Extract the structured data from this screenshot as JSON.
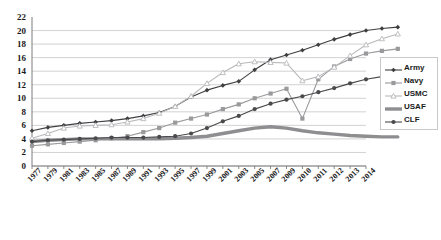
{
  "chart": {
    "type": "line",
    "title": "",
    "xlabel": "",
    "ylabel": "",
    "grid": true,
    "legend_position": "right",
    "ylim": [
      0,
      22
    ],
    "yticks": [
      0,
      2,
      4,
      6,
      8,
      10,
      12,
      14,
      16,
      18,
      20,
      22
    ],
    "xticks": [
      "1977",
      "1979",
      "1981",
      "1983",
      "1985",
      "1987",
      "1989",
      "1991",
      "1993",
      "1995",
      "1997",
      "1999",
      "2001",
      "2003",
      "2005",
      "2007",
      "2009",
      "2010",
      "2011",
      "2012",
      "2013",
      "2014"
    ],
    "colors": {
      "army": "#3f3f42",
      "navy": "#9a9a9d",
      "usmc": "#b9b9bc",
      "usaf": "#8e8e91",
      "clf": "#4a4a4d",
      "grid": "#c6c6c8",
      "axis": "#7d7d80",
      "text": "#1a1a1a"
    },
    "series": [
      {
        "name": "Army",
        "marker": "diamond",
        "values": [
          5.2,
          5.7,
          6.0,
          6.3,
          6.5,
          6.7,
          7.0,
          7.4,
          7.9,
          8.8,
          10.2,
          11.2,
          11.9,
          12.5,
          14.2,
          15.7,
          16.4,
          17.1,
          17.9,
          18.7,
          19.4,
          20.0,
          20.3,
          20.5
        ]
      },
      {
        "name": "Navy",
        "marker": "square",
        "values": [
          3.0,
          3.2,
          3.4,
          3.6,
          3.8,
          4.1,
          4.4,
          5.0,
          5.6,
          6.4,
          7.0,
          7.6,
          8.4,
          9.1,
          10.0,
          10.7,
          11.4,
          7.0,
          12.8,
          14.7,
          15.8,
          16.6,
          17.0,
          17.3
        ]
      },
      {
        "name": "USMC",
        "marker": "triangle",
        "values": [
          4.1,
          4.8,
          5.6,
          5.9,
          6.0,
          6.1,
          6.5,
          7.0,
          7.8,
          8.8,
          10.3,
          12.2,
          13.8,
          15.1,
          15.4,
          15.3,
          15.2,
          12.6,
          13.2,
          14.6,
          16.3,
          17.9,
          18.8,
          19.5
        ]
      },
      {
        "name": "USAF",
        "marker": "none",
        "values": [
          3.6,
          3.8,
          3.9,
          4.0,
          4.0,
          4.0,
          4.0,
          4.0,
          4.0,
          4.1,
          4.2,
          4.4,
          4.8,
          5.2,
          5.6,
          5.8,
          5.6,
          5.2,
          4.9,
          4.7,
          4.5,
          4.4,
          4.3,
          4.3
        ]
      },
      {
        "name": "CLF",
        "marker": "circle",
        "values": [
          3.6,
          3.8,
          3.9,
          4.0,
          4.1,
          4.2,
          4.2,
          4.2,
          4.3,
          4.4,
          4.8,
          5.6,
          6.6,
          7.4,
          8.4,
          9.2,
          9.8,
          10.3,
          10.9,
          11.5,
          12.2,
          12.8,
          13.2,
          13.6
        ]
      }
    ],
    "legend": [
      {
        "label": "Army",
        "marker": "diamond",
        "color": "#3f3f42",
        "thick": false
      },
      {
        "label": "Navy",
        "marker": "square",
        "color": "#9a9a9d",
        "thick": false
      },
      {
        "label": "USMC",
        "marker": "triangle",
        "color": "#b9b9bc",
        "thick": false
      },
      {
        "label": "USAF",
        "marker": "none",
        "color": "#8e8e91",
        "thick": true
      },
      {
        "label": "CLF",
        "marker": "circle",
        "color": "#4a4a4d",
        "thick": false
      }
    ]
  }
}
